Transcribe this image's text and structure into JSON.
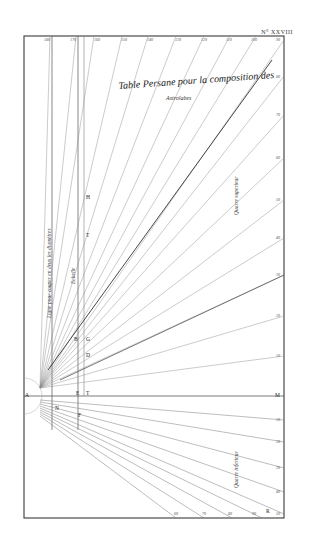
{
  "plate": {
    "number": "N° XXVIII",
    "title": "Table Persane pour la composition des",
    "subtitle": "Astrolabes",
    "colors": {
      "ink": "#2b2b2b",
      "paper": "#ffffff",
      "faint_line": "#9a9a9a"
    }
  },
  "vertical_labels": {
    "left_line": "Ligne pour couper en deux les diamètres",
    "middle_line": "Echelle",
    "upper_quadrant": "Quarre superieur",
    "lower_quadrant": "Quarre inferieur"
  },
  "points": [
    {
      "label": "A",
      "x": 25,
      "y": 396
    },
    {
      "label": "H",
      "x": 86,
      "y": 198
    },
    {
      "label": "T",
      "x": 86,
      "y": 236
    },
    {
      "label": "G",
      "x": 86,
      "y": 340
    },
    {
      "label": "B",
      "x": 75,
      "y": 340
    },
    {
      "label": "D",
      "x": 86,
      "y": 356
    },
    {
      "label": "E",
      "x": 77,
      "y": 393
    },
    {
      "label": "T",
      "x": 87,
      "y": 393
    },
    {
      "label": "N",
      "x": 56,
      "y": 409
    },
    {
      "label": "F",
      "x": 78,
      "y": 416
    },
    {
      "label": "M",
      "x": 275,
      "y": 396
    },
    {
      "label": "R",
      "x": 266,
      "y": 510
    }
  ],
  "scales": {
    "top": [
      "180",
      "170",
      "160",
      "150",
      "140",
      "130",
      "120",
      "110",
      "100",
      "90"
    ],
    "right": [
      "80",
      "70",
      "60",
      "50",
      "40",
      "30",
      "20",
      "10",
      "M",
      "10",
      "20",
      "30",
      "40",
      "50"
    ],
    "bottom": [
      "60",
      "70",
      "80",
      "90"
    ]
  }
}
